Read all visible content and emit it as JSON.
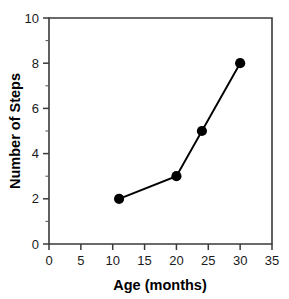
{
  "chart_data": {
    "type": "line",
    "title": "",
    "xlabel": "Age (months)",
    "ylabel": "Number of Steps",
    "x": [
      11,
      20,
      24,
      30
    ],
    "values": [
      2,
      3,
      5,
      8
    ],
    "series": [
      {
        "name": "Number of Steps",
        "x": [
          11,
          20,
          24,
          30
        ],
        "values": [
          2,
          3,
          5,
          8
        ],
        "marker": "filled-circle",
        "color": "#000000"
      }
    ],
    "xlim": [
      0,
      35
    ],
    "ylim": [
      0,
      10
    ],
    "x_ticks": [
      0,
      5,
      10,
      15,
      20,
      25,
      30,
      35
    ],
    "x_tick_labels": [
      "0",
      "5",
      "10",
      "15",
      "20",
      "25",
      "30",
      "35"
    ],
    "x_minor_ticks": [],
    "y_ticks": [
      0,
      2,
      4,
      6,
      8,
      10
    ],
    "y_tick_labels": [
      "0",
      "2",
      "4",
      "6",
      "8",
      "10"
    ],
    "y_minor_ticks": [
      1,
      3,
      5,
      7,
      9
    ],
    "grid": false,
    "legend": false,
    "legend_position": "none"
  },
  "axes": {
    "x_title": "Age (months)",
    "y_title": "Number of Steps"
  }
}
